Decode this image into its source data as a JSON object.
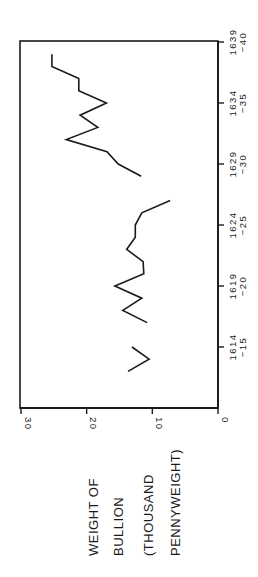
{
  "chart_data": {
    "type": "line",
    "orientation": "rotated-90-ccw",
    "title": "",
    "xlabel": "",
    "ylabel": "WEIGHT OF BULLION (THOUSAND PENNYWEIGHT)",
    "ylabel_lines": [
      "WEIGHT OF",
      "BULLION",
      "(THOUSAND",
      "PENNYWEIGHT)"
    ],
    "ylim": [
      0,
      30
    ],
    "y_ticks": [
      0,
      10,
      20,
      30
    ],
    "y_tick_labels": [
      "0",
      "10",
      "20",
      "30"
    ],
    "xlim": [
      1611,
      1639
    ],
    "x_ticks": [
      1614,
      1619,
      1624,
      1629,
      1634,
      1639
    ],
    "x_tick_labels": [
      {
        "top": "1614",
        "bottom": "-15"
      },
      {
        "top": "1619",
        "bottom": "-20"
      },
      {
        "top": "1624",
        "bottom": "-25"
      },
      {
        "top": "1629",
        "bottom": "-30"
      },
      {
        "top": "1634",
        "bottom": "-35"
      },
      {
        "top": "1639",
        "bottom": "-40"
      }
    ],
    "grid": false,
    "legend": null,
    "series": [
      {
        "name": "segment-1612-1614",
        "x": [
          1612,
          1613,
          1614
        ],
        "values": [
          13.7,
          10.5,
          13.1
        ]
      },
      {
        "name": "segment-1616-1626",
        "x": [
          1616,
          1617,
          1618,
          1619,
          1620,
          1621,
          1622,
          1623,
          1624,
          1625,
          1626
        ],
        "values": [
          10.8,
          14.5,
          11.6,
          15.7,
          11.3,
          11.4,
          13.9,
          12.6,
          12.6,
          11.6,
          7.3
        ]
      },
      {
        "name": "segment-1628-1638",
        "x": [
          1628,
          1629,
          1630,
          1631,
          1632,
          1633,
          1634,
          1635,
          1636,
          1637,
          1638
        ],
        "values": [
          11.7,
          15.2,
          16.9,
          23.1,
          18.3,
          21.0,
          17.0,
          21.2,
          21.2,
          25.3,
          25.3
        ]
      }
    ]
  }
}
